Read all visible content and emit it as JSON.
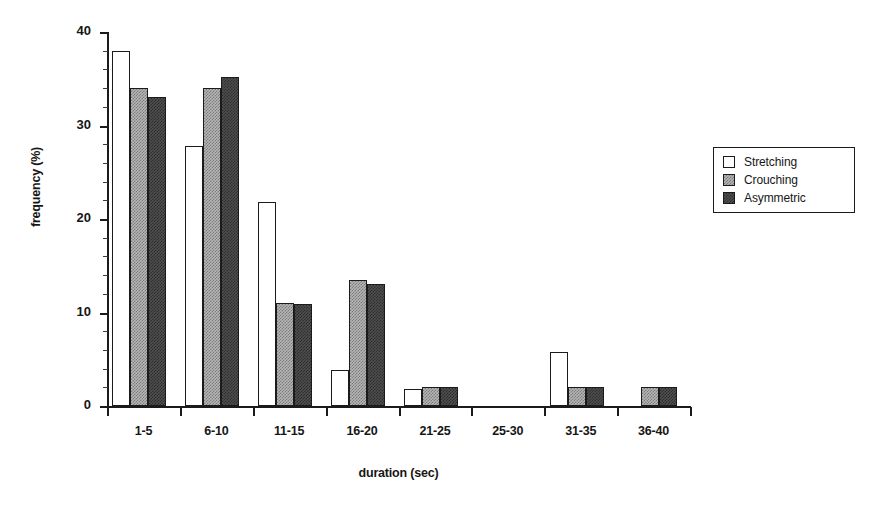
{
  "chart_data": {
    "type": "bar",
    "title": "",
    "xlabel": "duration (sec)",
    "ylabel": "frequency (%)",
    "categories": [
      "1-5",
      "6-10",
      "11-15",
      "16-20",
      "21-25",
      "25-30",
      "31-35",
      "36-40"
    ],
    "series": [
      {
        "name": "Stretching",
        "color": "#ffffff",
        "values": [
          38,
          27.8,
          21.8,
          3.8,
          1.8,
          0,
          5.8,
          0
        ]
      },
      {
        "name": "Crouching",
        "color": "#b5b5b5",
        "values": [
          34,
          34,
          11,
          13.5,
          2,
          0,
          2,
          2
        ]
      },
      {
        "name": "Asymmetric",
        "color": "#4e4e4e",
        "values": [
          33,
          35.2,
          10.9,
          13,
          2,
          0,
          2,
          2
        ]
      }
    ],
    "ylim": [
      0,
      40
    ],
    "yticks": [
      0,
      10,
      20,
      30,
      40
    ],
    "ytick_labels": [
      "0",
      "10",
      "20",
      "30",
      "40"
    ],
    "y_minor_step": 2,
    "grid": false,
    "legend_position": "right",
    "legend_entries": [
      "Stretching",
      "Crouching",
      "Asymmetric"
    ]
  }
}
